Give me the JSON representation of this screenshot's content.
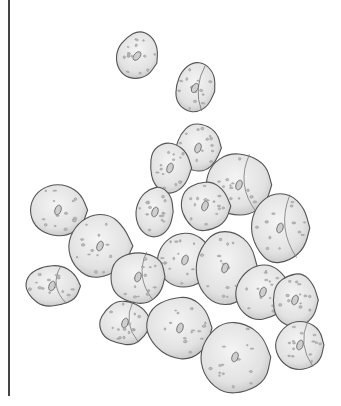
{
  "image": {
    "subject": "pencil illustration of a cluster of squamous epithelial cells",
    "style": "grayscale stippled drawing on white background",
    "colors": {
      "background": "#ffffff",
      "cell_fill": "#e6e6e6",
      "cell_shade": "#c8c8c8",
      "outline": "#555555",
      "border_line": "#444444"
    },
    "cells": [
      {
        "cx": 137,
        "cy": 56,
        "rx": 22,
        "ry": 26,
        "rot": 20
      },
      {
        "cx": 195,
        "cy": 88,
        "rx": 21,
        "ry": 27,
        "rot": 10
      },
      {
        "cx": 198,
        "cy": 148,
        "rx": 24,
        "ry": 26,
        "rot": 0
      },
      {
        "cx": 170,
        "cy": 168,
        "rx": 22,
        "ry": 28,
        "rot": 0
      },
      {
        "cx": 239,
        "cy": 185,
        "rx": 35,
        "ry": 34,
        "rot": 0
      },
      {
        "cx": 155,
        "cy": 212,
        "rx": 20,
        "ry": 27,
        "rot": 0
      },
      {
        "cx": 205,
        "cy": 206,
        "rx": 26,
        "ry": 27,
        "rot": 0
      },
      {
        "cx": 280,
        "cy": 228,
        "rx": 33,
        "ry": 37,
        "rot": 0
      },
      {
        "cx": 58,
        "cy": 210,
        "rx": 31,
        "ry": 29,
        "rot": 0
      },
      {
        "cx": 100,
        "cy": 246,
        "rx": 33,
        "ry": 34,
        "rot": 0
      },
      {
        "cx": 52,
        "cy": 286,
        "rx": 29,
        "ry": 22,
        "rot": 0
      },
      {
        "cx": 185,
        "cy": 260,
        "rx": 30,
        "ry": 30,
        "rot": 0
      },
      {
        "cx": 225,
        "cy": 268,
        "rx": 33,
        "ry": 38,
        "rot": 0
      },
      {
        "cx": 138,
        "cy": 277,
        "rx": 29,
        "ry": 28,
        "rot": 0
      },
      {
        "cx": 263,
        "cy": 292,
        "rx": 29,
        "ry": 30,
        "rot": 0
      },
      {
        "cx": 295,
        "cy": 300,
        "rx": 24,
        "ry": 28,
        "rot": 0
      },
      {
        "cx": 125,
        "cy": 323,
        "rx": 27,
        "ry": 24,
        "rot": 0
      },
      {
        "cx": 180,
        "cy": 328,
        "rx": 35,
        "ry": 34,
        "rot": 0
      },
      {
        "cx": 235,
        "cy": 357,
        "rx": 38,
        "ry": 39,
        "rot": 0
      },
      {
        "cx": 300,
        "cy": 345,
        "rx": 26,
        "ry": 27,
        "rot": 0
      }
    ]
  }
}
